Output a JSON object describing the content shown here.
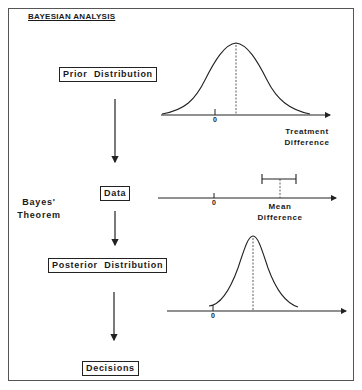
{
  "title": "BAYESIAN ANALYSIS",
  "flow": {
    "prior": "Prior  Distribution",
    "data": "Data",
    "posterior": "Posterior  Distribution",
    "decisions": "Decisions"
  },
  "side_label": {
    "line1": "Bayes'",
    "line2": "Theorem"
  },
  "plots": {
    "prior": {
      "zero_label": "0",
      "axis_label_line1": "Treatment",
      "axis_label_line2": "Difference"
    },
    "data": {
      "zero_label": "0",
      "axis_label_line1": "Mean",
      "axis_label_line2": "Difference"
    },
    "posterior": {
      "zero_label": "0"
    }
  }
}
